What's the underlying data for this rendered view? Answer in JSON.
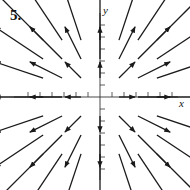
{
  "problem_number": "5.",
  "axes": {
    "x_label": "x",
    "y_label": "y",
    "origin_px": [
      100,
      97
    ],
    "tick_spacing_px": 12,
    "x_range_px": [
      14,
      178
    ],
    "y_range_px": [
      13,
      180
    ],
    "ticks_per_side": 6
  },
  "field": {
    "description": "Radial vector field F(x,y) = <x, y> (arrows point away from origin, length proportional to distance)",
    "grid": [
      -3,
      -2,
      -1,
      0,
      1,
      2,
      3
    ],
    "grid_spacing_px": 24,
    "scale": 0.42,
    "color": "#1a1a1a"
  }
}
